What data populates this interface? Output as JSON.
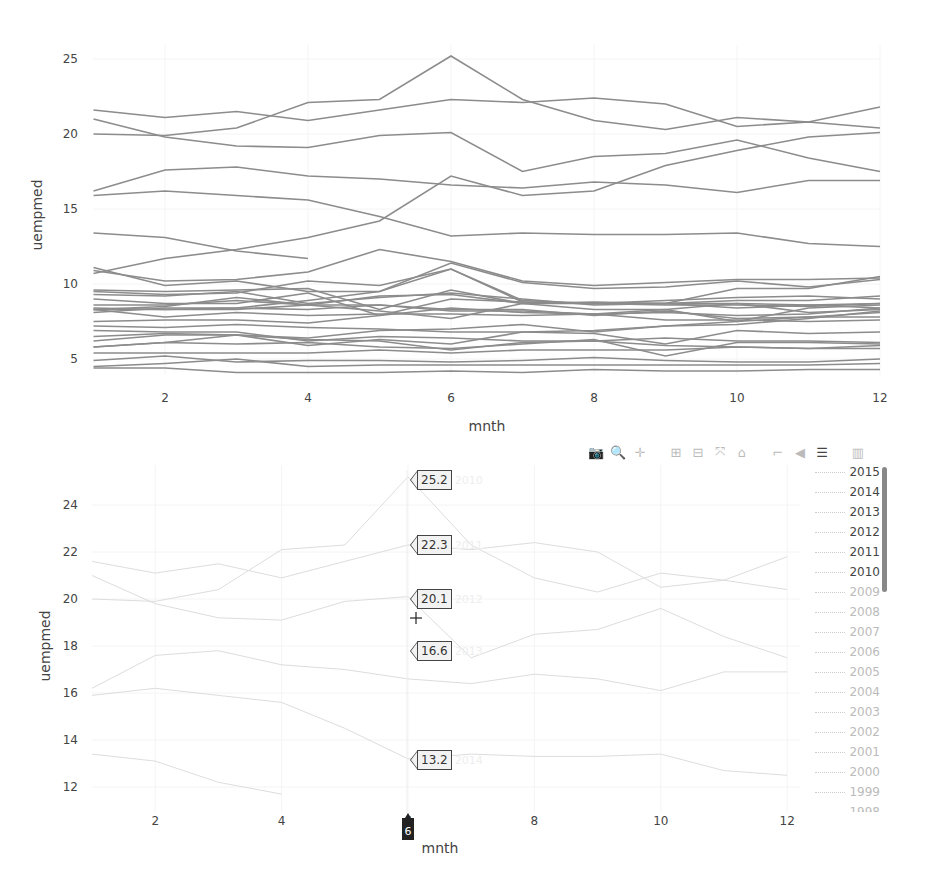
{
  "modebar": {
    "buttons": [
      {
        "name": "camera-icon",
        "label": "Download plot as a png",
        "glyph": "📷"
      },
      {
        "name": "zoom-icon",
        "label": "Zoom",
        "glyph": "🔍",
        "active": true
      },
      {
        "name": "pan-icon",
        "label": "Pan",
        "glyph": "✛"
      },
      {
        "name": "zoom-in-icon",
        "label": "Zoom in",
        "glyph": "⊞"
      },
      {
        "name": "zoom-out-icon",
        "label": "Zoom out",
        "glyph": "⊟"
      },
      {
        "name": "autoscale-icon",
        "label": "Autoscale",
        "glyph": "⤧"
      },
      {
        "name": "home-icon",
        "label": "Reset axes",
        "glyph": "⌂"
      },
      {
        "name": "spike-lines-icon",
        "label": "Toggle Spike Lines",
        "glyph": "⌐"
      },
      {
        "name": "hover-closest-icon",
        "label": "Show closest data on hover",
        "glyph": "◀"
      },
      {
        "name": "hover-compare-icon",
        "label": "Compare data on hover",
        "glyph": "☰",
        "active": true
      },
      {
        "name": "plotly-logo-icon",
        "label": "Produced with Plotly",
        "glyph": "▥"
      }
    ]
  },
  "hover": {
    "x_label": "6",
    "labels": [
      {
        "value": "25.2",
        "series": "2010"
      },
      {
        "value": "22.3",
        "series": "2011"
      },
      {
        "value": "20.1",
        "series": "2012"
      },
      {
        "value": "16.6",
        "series": "2013"
      },
      {
        "value": "13.2",
        "series": "2014"
      }
    ]
  },
  "legend": {
    "items": [
      {
        "label": "2015",
        "visible": true
      },
      {
        "label": "2014",
        "visible": true
      },
      {
        "label": "2013",
        "visible": true
      },
      {
        "label": "2012",
        "visible": true
      },
      {
        "label": "2011",
        "visible": true
      },
      {
        "label": "2010",
        "visible": true
      },
      {
        "label": "2009",
        "visible": false
      },
      {
        "label": "2008",
        "visible": false
      },
      {
        "label": "2007",
        "visible": false
      },
      {
        "label": "2006",
        "visible": false
      },
      {
        "label": "2005",
        "visible": false
      },
      {
        "label": "2004",
        "visible": false
      },
      {
        "label": "2003",
        "visible": false
      },
      {
        "label": "2002",
        "visible": false
      },
      {
        "label": "2001",
        "visible": false
      },
      {
        "label": "2000",
        "visible": false
      },
      {
        "label": "1999",
        "visible": false
      },
      {
        "label": "1998",
        "visible": false
      }
    ]
  },
  "chart_data": [
    {
      "type": "line",
      "title": "",
      "xlabel": "mnth",
      "ylabel": "uempmed",
      "xlim": [
        1,
        12
      ],
      "ylim": [
        3.9,
        25.5
      ],
      "xticks": [
        2,
        4,
        6,
        8,
        10,
        12
      ],
      "yticks": [
        5,
        10,
        15,
        20,
        25
      ],
      "line_color": "#8c8c8c",
      "grid": true,
      "legend": false,
      "x": [
        1,
        2,
        3,
        4,
        5,
        6,
        7,
        8,
        9,
        10,
        11,
        12
      ],
      "series": [
        {
          "name": "2010",
          "values": [
            20.0,
            19.9,
            20.4,
            22.1,
            22.3,
            25.2,
            22.3,
            20.9,
            20.3,
            21.1,
            20.8,
            21.8
          ]
        },
        {
          "name": "2011",
          "values": [
            21.6,
            21.1,
            21.5,
            20.9,
            21.6,
            22.3,
            22.1,
            22.4,
            22.0,
            20.5,
            20.8,
            20.4
          ]
        },
        {
          "name": "2012",
          "values": [
            21.0,
            19.8,
            19.2,
            19.1,
            19.9,
            20.1,
            17.5,
            18.5,
            18.7,
            19.6,
            18.4,
            17.5
          ]
        },
        {
          "name": "2013",
          "values": [
            16.2,
            17.6,
            17.8,
            17.2,
            17.0,
            16.6,
            16.4,
            16.8,
            16.6,
            16.1,
            16.9,
            16.9
          ]
        },
        {
          "name": "2014",
          "values": [
            15.9,
            16.2,
            15.9,
            15.6,
            14.5,
            13.2,
            13.4,
            13.3,
            13.3,
            13.4,
            12.7,
            12.5
          ]
        },
        {
          "name": "2015",
          "values": [
            13.4,
            13.1,
            12.2,
            11.7,
            null,
            null,
            null,
            null,
            null,
            null,
            null,
            null
          ]
        },
        {
          "name": "2009",
          "values": [
            10.7,
            11.7,
            12.3,
            13.1,
            14.2,
            17.2,
            15.9,
            16.2,
            17.9,
            18.9,
            19.8,
            20.1
          ]
        },
        {
          "name": "2008",
          "values": [
            9.0,
            8.7,
            8.7,
            9.4,
            7.9,
            9.0,
            8.8,
            8.7,
            8.7,
            9.7,
            9.7,
            10.5
          ]
        },
        {
          "name": "1995",
          "values": [
            11.1,
            9.9,
            10.2,
            9.5,
            9.5,
            11.4,
            10.1,
            9.7,
            9.8,
            10.2,
            9.8,
            10.3
          ]
        },
        {
          "name": "1994",
          "values": [
            10.9,
            10.2,
            10.3,
            10.8,
            12.3,
            11.5,
            10.2,
            9.9,
            10.1,
            10.3,
            10.3,
            10.4
          ]
        },
        {
          "name": "2003",
          "values": [
            9.5,
            9.3,
            9.4,
            10.2,
            9.9,
            11.0,
            8.8,
            8.7,
            8.6,
            8.6,
            8.5,
            8.7
          ]
        },
        {
          "name": "1993",
          "values": [
            9.6,
            9.5,
            9.6,
            9.7,
            8.3,
            9.6,
            8.7,
            8.7,
            8.9,
            9.1,
            9.2,
            9.0
          ]
        },
        {
          "name": "2004",
          "values": [
            9.3,
            9.2,
            9.5,
            8.7,
            9.1,
            9.4,
            9.0,
            8.6,
            8.7,
            8.9,
            8.9,
            9.2
          ]
        },
        {
          "name": "2002",
          "values": [
            8.4,
            8.3,
            8.4,
            8.9,
            9.5,
            11.0,
            8.9,
            8.7,
            8.7,
            8.7,
            8.6,
            8.7
          ]
        },
        {
          "name": "1992",
          "values": [
            8.6,
            8.6,
            8.9,
            8.6,
            9.2,
            9.3,
            8.7,
            8.3,
            8.3,
            8.7,
            8.1,
            8.3
          ]
        },
        {
          "name": "2005",
          "values": [
            8.1,
            8.4,
            8.4,
            8.3,
            8.6,
            8.2,
            8.2,
            8.0,
            8.1,
            7.9,
            8.0,
            8.4
          ]
        },
        {
          "name": "2006",
          "values": [
            7.5,
            7.6,
            7.6,
            7.4,
            7.9,
            8.4,
            8.1,
            8.0,
            8.3,
            7.5,
            8.4,
            8.6
          ]
        },
        {
          "name": "1996",
          "values": [
            8.3,
            8.3,
            8.3,
            8.6,
            8.6,
            8.3,
            8.3,
            7.9,
            8.2,
            7.7,
            7.8,
            7.8
          ]
        },
        {
          "name": "2001",
          "values": [
            5.8,
            6.1,
            6.6,
            5.9,
            6.3,
            6.0,
            6.8,
            6.9,
            7.2,
            7.3,
            7.7,
            8.2
          ]
        },
        {
          "name": "2007",
          "values": [
            8.3,
            8.5,
            9.1,
            8.6,
            8.2,
            7.7,
            8.7,
            8.8,
            8.7,
            8.4,
            8.6,
            8.4
          ]
        },
        {
          "name": "1997",
          "values": [
            8.3,
            7.8,
            8.1,
            7.9,
            8.0,
            8.0,
            7.9,
            8.0,
            7.6,
            7.6,
            7.5,
            7.6
          ]
        },
        {
          "name": "1998",
          "values": [
            7.2,
            7.1,
            7.3,
            7.1,
            7.0,
            6.8,
            6.8,
            6.7,
            6.0,
            6.9,
            6.7,
            6.8
          ]
        },
        {
          "name": "1999",
          "values": [
            6.9,
            6.8,
            6.8,
            6.2,
            6.5,
            6.4,
            6.2,
            6.2,
            6.4,
            6.2,
            6.2,
            6.1
          ]
        },
        {
          "name": "2000",
          "values": [
            5.8,
            6.1,
            6.0,
            6.1,
            5.8,
            5.7,
            6.0,
            6.3,
            5.2,
            6.1,
            6.1,
            6.0
          ]
        },
        {
          "name": "1991",
          "values": [
            6.2,
            6.6,
            6.6,
            6.4,
            6.9,
            7.0,
            7.3,
            6.8,
            7.2,
            7.5,
            7.8,
            8.1
          ]
        },
        {
          "name": "1990",
          "values": [
            5.4,
            5.4,
            5.4,
            5.4,
            5.6,
            5.4,
            5.6,
            5.6,
            5.6,
            5.8,
            5.7,
            5.9
          ]
        },
        {
          "name": "1989",
          "values": [
            4.9,
            5.2,
            4.8,
            4.9,
            4.9,
            4.8,
            4.9,
            5.1,
            4.9,
            4.8,
            4.8,
            5.0
          ]
        },
        {
          "name": "1988",
          "values": [
            6.5,
            6.7,
            6.6,
            6.3,
            6.2,
            5.6,
            6.1,
            6.2,
            5.9,
            5.8,
            5.7,
            5.7
          ]
        },
        {
          "name": "1970",
          "values": [
            4.5,
            4.7,
            5.0,
            4.5,
            4.6,
            4.6,
            4.6,
            4.6,
            4.6,
            4.6,
            4.6,
            4.7
          ]
        },
        {
          "name": "1969",
          "values": [
            4.4,
            4.4,
            4.1,
            4.1,
            4.1,
            4.2,
            4.1,
            4.3,
            4.2,
            4.2,
            4.3,
            4.3
          ]
        }
      ]
    },
    {
      "type": "line",
      "title": "",
      "xlabel": "mnth",
      "ylabel": "uempmed",
      "xlim": [
        1,
        13
      ],
      "ylim": [
        11.5,
        25.5
      ],
      "xticks": [
        2,
        4,
        6,
        8,
        10,
        12
      ],
      "yticks": [
        12,
        14,
        16,
        18,
        20,
        22,
        24
      ],
      "line_color": "#dddddd",
      "grid": true,
      "legend": true,
      "legend_position": "right",
      "hovermode": "x",
      "hover_x": 6,
      "x": [
        1,
        2,
        3,
        4,
        5,
        6,
        7,
        8,
        9,
        10,
        11,
        12
      ],
      "series": [
        {
          "name": "2015",
          "values": [
            13.4,
            13.1,
            12.2,
            11.7,
            null,
            null,
            null,
            null,
            null,
            null,
            null,
            null
          ]
        },
        {
          "name": "2014",
          "values": [
            15.9,
            16.2,
            15.9,
            15.6,
            14.5,
            13.2,
            13.4,
            13.3,
            13.3,
            13.4,
            12.7,
            12.5
          ]
        },
        {
          "name": "2013",
          "values": [
            16.2,
            17.6,
            17.8,
            17.2,
            17.0,
            16.6,
            16.4,
            16.8,
            16.6,
            16.1,
            16.9,
            16.9
          ]
        },
        {
          "name": "2012",
          "values": [
            21.0,
            19.8,
            19.2,
            19.1,
            19.9,
            20.1,
            17.5,
            18.5,
            18.7,
            19.6,
            18.4,
            17.5
          ]
        },
        {
          "name": "2011",
          "values": [
            21.6,
            21.1,
            21.5,
            20.9,
            21.6,
            22.3,
            22.1,
            22.4,
            22.0,
            20.5,
            20.8,
            20.4
          ]
        },
        {
          "name": "2010",
          "values": [
            20.0,
            19.9,
            20.4,
            22.1,
            22.3,
            25.2,
            22.3,
            20.9,
            20.3,
            21.1,
            20.8,
            21.8
          ]
        }
      ]
    }
  ],
  "axes": {
    "top": {
      "xlabel": "mnth",
      "ylabel": "uempmed",
      "xticks": [
        "2",
        "4",
        "6",
        "8",
        "10",
        "12"
      ],
      "yticks": [
        "25",
        "20",
        "15",
        "10",
        "5"
      ]
    },
    "bottom": {
      "xlabel": "mnth",
      "ylabel": "uempmed",
      "xticks": [
        "2",
        "4",
        "6",
        "8",
        "10",
        "12"
      ],
      "yticks": [
        "24",
        "22",
        "20",
        "18",
        "16",
        "14",
        "12"
      ]
    }
  }
}
